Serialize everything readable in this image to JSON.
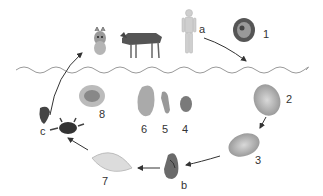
{
  "diagram": {
    "type": "parasite-lifecycle",
    "divider": "wavy-line",
    "hosts_above_line": [
      {
        "id": "cat",
        "icon": "cat-icon"
      },
      {
        "id": "wolf",
        "icon": "wolf-icon"
      },
      {
        "id": "human",
        "icon": "human-figure-icon",
        "label": "a"
      }
    ],
    "stages": [
      {
        "num": "1",
        "icon": "egg-icon"
      },
      {
        "num": "2",
        "icon": "egg-icon"
      },
      {
        "num": "3",
        "icon": "miracidium-egg-icon"
      },
      {
        "num": "4",
        "icon": "sporocyst-icon"
      },
      {
        "num": "5",
        "icon": "redia-icon"
      },
      {
        "num": "6",
        "icon": "redia-icon"
      },
      {
        "num": "7",
        "icon": "cercaria-icon"
      },
      {
        "num": "8",
        "icon": "metacercaria-icon"
      }
    ],
    "intermediate_hosts": [
      {
        "id": "snail",
        "icon": "snail-icon",
        "label": "b"
      },
      {
        "id": "crab",
        "icon": "crab-icon",
        "label": "c"
      },
      {
        "id": "crayfish",
        "icon": "crayfish-icon"
      }
    ],
    "labels": {
      "a": "a",
      "b": "b",
      "c": "c",
      "n1": "1",
      "n2": "2",
      "n3": "3",
      "n4": "4",
      "n5": "5",
      "n6": "6",
      "n7": "7",
      "n8": "8"
    }
  }
}
